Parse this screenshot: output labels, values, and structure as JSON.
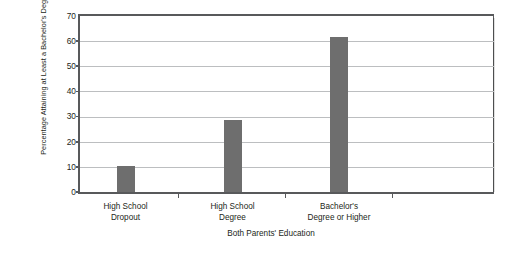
{
  "chart_data": {
    "type": "bar",
    "title": "",
    "subtitle": "",
    "xlabel": "Both Parents' Education",
    "ylabel": "Percentage Attaining at Least a Bachelor's Degree",
    "ylabel_line1": "Percentage Attaining at",
    "ylabel_line2": "Least a Bachelor's Degree",
    "categories": [
      "High School Dropout",
      "High School Degree",
      "Bachelor's Degree or Higher"
    ],
    "category_lines": [
      [
        "High School",
        "Dropout"
      ],
      [
        "High School",
        "Degree"
      ],
      [
        "Bachelor's",
        "Degree or Higher"
      ]
    ],
    "values": [
      10.5,
      28.5,
      61.5
    ],
    "ylim": [
      0,
      70
    ],
    "ytick_values": [
      0,
      10,
      20,
      30,
      40,
      50,
      60,
      70
    ],
    "ytick_labels": [
      "0",
      "10",
      "20",
      "30",
      "40",
      "50",
      "60",
      "70"
    ],
    "xlim_labels": [],
    "grid": "horizontal",
    "legend": "none",
    "bar_color": "#6e6e6e",
    "grid_color": "#bcbec0",
    "axis_color": "#58595b",
    "text_color": "#231f20",
    "background": "#ffffff"
  }
}
